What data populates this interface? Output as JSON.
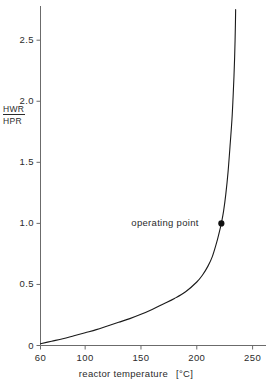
{
  "chart_data": {
    "type": "line",
    "title": "",
    "xlabel": "reactor temperature",
    "xunit": "[°C]",
    "ylabel_numerator": "HWR",
    "ylabel_denominator": "HPR",
    "xlim": [
      60,
      262
    ],
    "ylim": [
      0,
      2.78
    ],
    "grid": false,
    "legend": null,
    "xticks": [
      60,
      100,
      150,
      200,
      250
    ],
    "xtick_labels": [
      "60",
      "100",
      "150",
      "200",
      "250"
    ],
    "yticks": [
      0,
      0.5,
      1.0,
      1.5,
      2.0,
      2.5
    ],
    "ytick_labels": [
      "0",
      "0.5",
      "1.0",
      "1.5",
      "2.0",
      "2.5"
    ],
    "series": [
      {
        "name": "HWR/HPR",
        "color": "#1a1a1a",
        "x": [
          60,
          70,
          80,
          90,
          100,
          110,
          120,
          130,
          140,
          150,
          160,
          170,
          180,
          190,
          200,
          205,
          210,
          214,
          218,
          221,
          222,
          224,
          226,
          228,
          230,
          231.5,
          232.5,
          233.3,
          233.9,
          234.3,
          234.6,
          234.8
        ],
        "y": [
          0.015,
          0.035,
          0.055,
          0.08,
          0.105,
          0.13,
          0.16,
          0.19,
          0.22,
          0.255,
          0.295,
          0.34,
          0.385,
          0.44,
          0.52,
          0.575,
          0.65,
          0.73,
          0.85,
          0.96,
          1.0,
          1.1,
          1.24,
          1.42,
          1.66,
          1.85,
          2.03,
          2.2,
          2.36,
          2.5,
          2.63,
          2.75
        ]
      }
    ],
    "annotations": [
      {
        "label": "operating point",
        "x": 222,
        "y": 1.0,
        "marker": "filled-circle",
        "marker_color": "#111111"
      }
    ]
  },
  "axis": {
    "line_color": "#6b6b6b",
    "tick_color": "#6b6b6b"
  }
}
